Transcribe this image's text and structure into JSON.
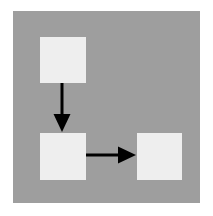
{
  "canvas": {
    "width": 213,
    "height": 216,
    "background_color": "#ffffff"
  },
  "panel": {
    "label": "diagram-background-panel",
    "x": 13,
    "y": 11,
    "width": 187,
    "height": 192,
    "fill_color": "#9e9e9e"
  },
  "diagram": {
    "type": "flowchart",
    "title": "",
    "node_fill_color": "#eeeeee",
    "connector_color": "#000000",
    "connector_stroke_width": 3,
    "nodes": [
      {
        "id": "node-1",
        "name": "node-top-left",
        "label": "",
        "x": 40,
        "y": 37,
        "width": 46,
        "height": 46
      },
      {
        "id": "node-2",
        "name": "node-middle-left",
        "label": "",
        "x": 40,
        "y": 133,
        "width": 46,
        "height": 47
      },
      {
        "id": "node-3",
        "name": "node-middle-right",
        "label": "",
        "x": 137,
        "y": 133,
        "width": 45,
        "height": 47
      }
    ],
    "connectors": [
      {
        "id": "connector-1",
        "name": "arrow-down-node1-to-node2",
        "label": "",
        "direction": "down",
        "from": "node-1",
        "to": "node-2",
        "x1": 62,
        "y1": 83,
        "x2": 62,
        "y2": 132,
        "arrowhead_width": 17,
        "arrowhead_length": 18
      },
      {
        "id": "connector-2",
        "name": "arrow-right-node2-to-node3",
        "label": "",
        "direction": "right",
        "from": "node-2",
        "to": "node-3",
        "x1": 86,
        "y1": 155,
        "x2": 136,
        "y2": 155,
        "arrowhead_width": 17,
        "arrowhead_length": 18
      }
    ]
  }
}
